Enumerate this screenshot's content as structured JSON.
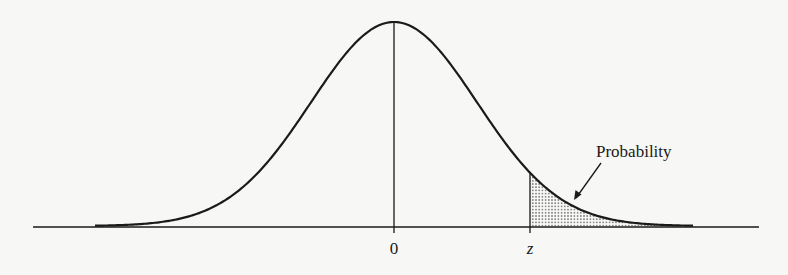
{
  "diagram": {
    "type": "standard-normal-curve",
    "labels": {
      "center_tick": "0",
      "z_tick": "z",
      "shaded_region": "Probability"
    },
    "colors": {
      "background": "#f7f7f5",
      "ink": "#1a1a1a",
      "shade_dot": "#555555"
    }
  }
}
